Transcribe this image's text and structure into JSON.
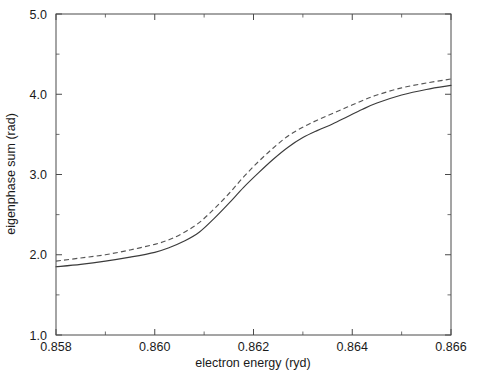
{
  "chart_data": {
    "type": "line",
    "title": "",
    "xlabel": "electron energy (ryd)",
    "ylabel": "eigenphase sum (rad)",
    "xlim": [
      0.858,
      0.866
    ],
    "ylim": [
      1.0,
      5.0
    ],
    "grid": false,
    "legend_position": "none",
    "x_ticks_major": [
      0.858,
      0.86,
      0.862,
      0.864,
      0.866
    ],
    "x_tick_labels": [
      "0.858",
      "0.860",
      "0.862",
      "0.864",
      "0.866"
    ],
    "x_ticks_minor": [
      0.859,
      0.861,
      0.863,
      0.865
    ],
    "y_ticks_major": [
      1.0,
      2.0,
      3.0,
      4.0,
      5.0
    ],
    "y_tick_labels": [
      "1.0",
      "2.0",
      "3.0",
      "4.0",
      "5.0"
    ],
    "y_ticks_minor": [
      1.5,
      2.5,
      3.5,
      4.5
    ],
    "series": [
      {
        "name": "solid-curve",
        "style": "solid",
        "color": "#3b3b3b",
        "x": [
          0.858,
          0.8585,
          0.859,
          0.8595,
          0.86,
          0.8603,
          0.8606,
          0.8609,
          0.8612,
          0.8615,
          0.8618,
          0.8621,
          0.8624,
          0.8627,
          0.863,
          0.8633,
          0.8636,
          0.8639,
          0.8642,
          0.8645,
          0.865,
          0.8655,
          0.866
        ],
        "y": [
          1.85,
          1.88,
          1.92,
          1.97,
          2.03,
          2.09,
          2.17,
          2.28,
          2.45,
          2.64,
          2.84,
          3.02,
          3.19,
          3.34,
          3.46,
          3.55,
          3.63,
          3.72,
          3.81,
          3.89,
          3.99,
          4.06,
          4.11
        ]
      },
      {
        "name": "dashed-curve",
        "style": "dashed",
        "color": "#555555",
        "x": [
          0.858,
          0.8585,
          0.859,
          0.8595,
          0.86,
          0.8603,
          0.8606,
          0.8609,
          0.8612,
          0.8615,
          0.8618,
          0.8621,
          0.8624,
          0.8627,
          0.863,
          0.8633,
          0.8636,
          0.8639,
          0.8642,
          0.8645,
          0.865,
          0.8655,
          0.866
        ],
        "y": [
          1.92,
          1.96,
          2.0,
          2.06,
          2.13,
          2.19,
          2.28,
          2.4,
          2.57,
          2.76,
          2.97,
          3.16,
          3.33,
          3.48,
          3.59,
          3.68,
          3.76,
          3.84,
          3.92,
          3.99,
          4.08,
          4.14,
          4.19
        ]
      }
    ]
  },
  "plot_geometry": {
    "left_px": 56,
    "right_px": 451,
    "top_px": 14,
    "bottom_px": 335
  }
}
